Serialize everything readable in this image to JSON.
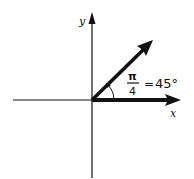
{
  "diagram": {
    "axes": {
      "x_label": "x",
      "y_label": "y"
    },
    "vectors": [
      {
        "name": "x-axis-vector",
        "angle_deg": 0
      },
      {
        "name": "rotated-vector",
        "angle_deg": 45
      }
    ],
    "angle_annotation": {
      "numerator": "π",
      "denominator": "4",
      "equals": "=",
      "degrees": "45°"
    },
    "colors": {
      "ink": "#111111",
      "background": "#ffffff"
    }
  }
}
